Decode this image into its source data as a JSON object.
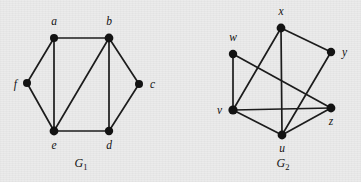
{
  "figure": {
    "background_color": "#ebebeb",
    "ink_color": "#131313",
    "width": 361,
    "height": 182
  },
  "graphs": [
    {
      "id": "G1",
      "caption_base": "G",
      "caption_sub": "1",
      "caption_x": 81,
      "caption_y": 167,
      "vertices": [
        {
          "id": "a",
          "label": "a",
          "x": 54,
          "y": 38,
          "r": 4.0,
          "label_x": 54,
          "label_y": 25,
          "anchor": "middle"
        },
        {
          "id": "b",
          "label": "b",
          "x": 109,
          "y": 38,
          "r": 4.4,
          "label_x": 109,
          "label_y": 25,
          "anchor": "middle"
        },
        {
          "id": "c",
          "label": "c",
          "x": 139,
          "y": 84,
          "r": 4.0,
          "label_x": 150,
          "label_y": 88,
          "anchor": "start"
        },
        {
          "id": "d",
          "label": "d",
          "x": 109,
          "y": 131,
          "r": 4.2,
          "label_x": 109,
          "label_y": 149,
          "anchor": "middle"
        },
        {
          "id": "e",
          "label": "e",
          "x": 54,
          "y": 131,
          "r": 4.4,
          "label_x": 54,
          "label_y": 149,
          "anchor": "middle"
        },
        {
          "id": "f",
          "label": "f",
          "x": 27,
          "y": 83,
          "r": 4.0,
          "label_x": 17,
          "label_y": 88,
          "anchor": "end"
        }
      ],
      "edges": [
        [
          "a",
          "b"
        ],
        [
          "a",
          "f"
        ],
        [
          "a",
          "e"
        ],
        [
          "b",
          "c"
        ],
        [
          "b",
          "d"
        ],
        [
          "b",
          "e"
        ],
        [
          "c",
          "d"
        ],
        [
          "d",
          "e"
        ],
        [
          "e",
          "f"
        ]
      ]
    },
    {
      "id": "G2",
      "caption_base": "G",
      "caption_sub": "2",
      "caption_x": 283,
      "caption_y": 167,
      "vertices": [
        {
          "id": "x",
          "label": "x",
          "x": 281,
          "y": 28,
          "r": 4.4,
          "label_x": 281,
          "label_y": 15,
          "anchor": "middle"
        },
        {
          "id": "w",
          "label": "w",
          "x": 233,
          "y": 54,
          "r": 4.2,
          "label_x": 233,
          "label_y": 41,
          "anchor": "middle"
        },
        {
          "id": "y",
          "label": "y",
          "x": 331,
          "y": 52,
          "r": 4.2,
          "label_x": 342,
          "label_y": 56,
          "anchor": "start"
        },
        {
          "id": "v",
          "label": "v",
          "x": 233,
          "y": 110,
          "r": 4.6,
          "label_x": 222,
          "label_y": 114,
          "anchor": "end"
        },
        {
          "id": "z",
          "label": "z",
          "x": 331,
          "y": 108,
          "r": 4.4,
          "label_x": 331,
          "label_y": 125,
          "anchor": "middle"
        },
        {
          "id": "u",
          "label": "u",
          "x": 282,
          "y": 135,
          "r": 4.4,
          "label_x": 282,
          "label_y": 152,
          "anchor": "middle"
        }
      ],
      "edges": [
        [
          "x",
          "y"
        ],
        [
          "x",
          "v"
        ],
        [
          "x",
          "u"
        ],
        [
          "w",
          "v"
        ],
        [
          "w",
          "z"
        ],
        [
          "y",
          "u"
        ],
        [
          "v",
          "z"
        ],
        [
          "v",
          "u"
        ],
        [
          "u",
          "z"
        ]
      ]
    }
  ]
}
